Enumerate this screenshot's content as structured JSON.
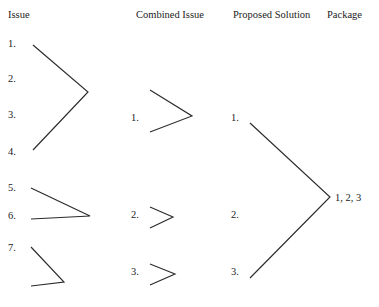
{
  "diagram": {
    "background_color": "#ffffff",
    "line_color": "#2b2b2b",
    "text_color": "#1c1c1c",
    "columns": [
      {
        "id": "issue",
        "header": "Issue",
        "x": 8,
        "y": 15
      },
      {
        "id": "combined_issue",
        "header": "Combined Issue",
        "x": 136,
        "y": 15
      },
      {
        "id": "proposed_solution",
        "header": "Proposed Solution",
        "x": 233,
        "y": 15
      },
      {
        "id": "package",
        "header": "Package",
        "x": 327,
        "y": 15
      }
    ],
    "nodes": {
      "issue": [
        {
          "label": "1.",
          "x": 8,
          "y": 38
        },
        {
          "label": "2.",
          "x": 8,
          "y": 73
        },
        {
          "label": "3.",
          "x": 8,
          "y": 109
        },
        {
          "label": "4.",
          "x": 8,
          "y": 146
        },
        {
          "label": "5.",
          "x": 8,
          "y": 182
        },
        {
          "label": "6.",
          "x": 8,
          "y": 210
        },
        {
          "label": "7.",
          "x": 8,
          "y": 242
        }
      ],
      "combined_issue": [
        {
          "label": "1.",
          "x": 131,
          "y": 112
        },
        {
          "label": "2.",
          "x": 131,
          "y": 209
        },
        {
          "label": "3.",
          "x": 131,
          "y": 266
        }
      ],
      "proposed_solution": [
        {
          "label": "1.",
          "x": 231,
          "y": 112
        },
        {
          "label": "2.",
          "x": 231,
          "y": 209
        },
        {
          "label": "3.",
          "x": 231,
          "y": 266
        }
      ],
      "package": [
        {
          "label": "1, 2, 3",
          "x": 335,
          "y": 192
        }
      ]
    },
    "connectors": [
      {
        "id": "issue-bracket-1-4",
        "points": "33,45 88,92 33,150"
      },
      {
        "id": "issue-bracket-5-6",
        "points": "31,188 90,216 31,219"
      },
      {
        "id": "issue-bracket-7",
        "points": "31,247 64,282 31,286"
      },
      {
        "id": "combined-bracket-1",
        "points": "150,90 192,116 150,132"
      },
      {
        "id": "combined-bracket-2",
        "points": "150,207 173,217 150,228"
      },
      {
        "id": "combined-bracket-3",
        "points": "150,264 175,274 150,285"
      },
      {
        "id": "solution-bracket-1-3",
        "points": "250,123 330,197 250,278"
      }
    ]
  }
}
